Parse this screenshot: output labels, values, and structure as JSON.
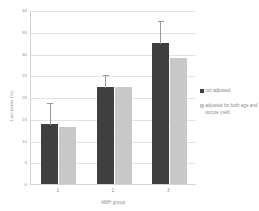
{
  "chart_data": {
    "type": "bar",
    "title": "",
    "xlabel": "AMH group",
    "ylabel": "Live births (%)",
    "categories": [
      "1",
      "2",
      "3"
    ],
    "ylim": [
      0,
      40
    ],
    "yticks": [
      0,
      5,
      10,
      15,
      20,
      25,
      30,
      35,
      40
    ],
    "ytick_labels": [
      "0",
      "5",
      "10",
      "15",
      "20",
      "25",
      "30",
      "35",
      "40"
    ],
    "grid": true,
    "legend_position": "right",
    "series": [
      {
        "name": "not adjusted",
        "color": "#3f3f3f",
        "values": [
          13.8,
          22.2,
          32.5
        ],
        "error_upper": [
          18.8,
          25.3,
          37.8
        ],
        "error_lower": [
          13.8,
          22.2,
          32.5
        ]
      },
      {
        "name": "adjusted for both age and oocyte yield",
        "color": "#c8c8c8",
        "values": [
          13.2,
          22.4,
          29.0
        ],
        "error_upper": [
          null,
          null,
          null
        ],
        "error_lower": [
          null,
          null,
          null
        ]
      }
    ]
  },
  "legend": {
    "entries": [
      {
        "label": "not adjusted",
        "color": "#3f3f3f"
      },
      {
        "label": "adjusted for both age and oocyte yield",
        "color": "#c8c8c8"
      }
    ]
  },
  "axes": {
    "y_title": "Live births (%)",
    "x_title": "AMH group"
  }
}
